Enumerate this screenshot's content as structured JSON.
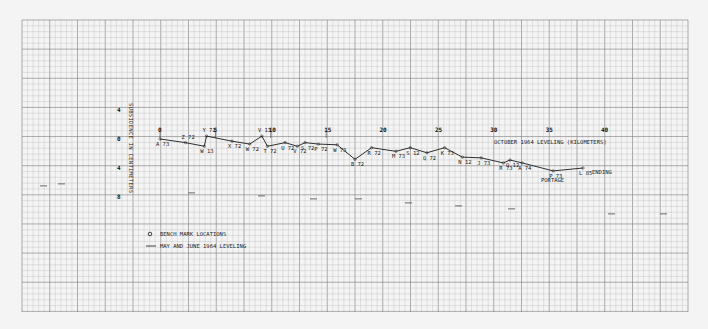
{
  "chart_data": {
    "type": "line",
    "title": "",
    "xlabel": "OCTOBER 1964 LEVELING (KILOMETERS)",
    "ylabel": "SUBSIDENCE IN CENTIMETERS",
    "x_ticks": [
      0,
      5,
      10,
      15,
      20,
      25,
      30,
      35,
      40
    ],
    "y_ticks": [
      -4,
      0,
      4,
      8
    ],
    "y_tick_labels": [
      "4",
      "0",
      "4",
      "8"
    ],
    "xlim": [
      0,
      40
    ],
    "ylim": [
      -4,
      8
    ],
    "grid": true,
    "legend": [
      {
        "symbol": "circle",
        "label": "BENCH MARK LOCATIONS"
      },
      {
        "symbol": "line",
        "label": "MAY AND JUNE 1964 LEVELING"
      }
    ],
    "series": [
      {
        "name": "MAY AND JUNE 1964 LEVELING",
        "points": [
          {
            "label": "A 73",
            "x": 0.0,
            "y": 0.0
          },
          {
            "label": "Z 72",
            "x": 2.3,
            "y": 0.5
          },
          {
            "label": "W 13",
            "x": 4.0,
            "y": 1.0
          },
          {
            "label": "Y 72",
            "x": 4.2,
            "y": -0.4
          },
          {
            "label": "X 72",
            "x": 6.5,
            "y": 0.3
          },
          {
            "label": "W 72",
            "x": 8.1,
            "y": 0.7
          },
          {
            "label": "V 13",
            "x": 9.2,
            "y": -0.4
          },
          {
            "label": "T 72",
            "x": 9.7,
            "y": 1.0
          },
          {
            "label": "U 72",
            "x": 11.3,
            "y": 0.5
          },
          {
            "label": "V 72",
            "x": 12.4,
            "y": 1.0
          },
          {
            "label": "S 72",
            "x": 13.1,
            "y": 0.5
          },
          {
            "label": "P 72",
            "x": 14.3,
            "y": 0.7
          },
          {
            "label": "W 73",
            "x": 16.0,
            "y": 0.8
          },
          {
            "label": "B 72",
            "x": 17.6,
            "y": 2.8
          },
          {
            "label": "R 72",
            "x": 19.1,
            "y": 1.2
          },
          {
            "label": "M 73",
            "x": 21.3,
            "y": 1.7
          },
          {
            "label": "S 12",
            "x": 22.6,
            "y": 1.2
          },
          {
            "label": "Q 72",
            "x": 24.1,
            "y": 1.9
          },
          {
            "label": "K 73",
            "x": 25.7,
            "y": 1.2
          },
          {
            "label": "N 12",
            "x": 27.3,
            "y": 2.5
          },
          {
            "label": "J 73",
            "x": 29.0,
            "y": 2.6
          },
          {
            "label": "R 73",
            "x": 31.0,
            "y": 3.3
          },
          {
            "label": "Q 12",
            "x": 31.6,
            "y": 2.9
          },
          {
            "label": "A 74",
            "x": 32.7,
            "y": 3.3
          },
          {
            "label": "P 73",
            "x": 35.5,
            "y": 4.4
          },
          {
            "label": "L 85",
            "x": 38.2,
            "y": 4.0
          }
        ]
      }
    ],
    "annotations": [
      {
        "text": "PORTAGE",
        "near": "P 73"
      },
      {
        "text": "ENDING",
        "near": "L 85"
      }
    ]
  },
  "ui": {
    "x_axis_title": "OCTOBER 1964 LEVELING (KILOMETERS)",
    "y_axis_title": "SUBSIDENCE IN CENTIMETERS",
    "legend_bench": "BENCH MARK LOCATIONS",
    "legend_line": "MAY AND JUNE 1964 LEVELING",
    "portage": "PORTAGE",
    "ending": "ENDING"
  },
  "colors": {
    "paper": "#f4f4f4",
    "grid_minor": "#b8b8b8",
    "grid_major": "#7a7a7a",
    "ink": "#1a1a1a"
  }
}
